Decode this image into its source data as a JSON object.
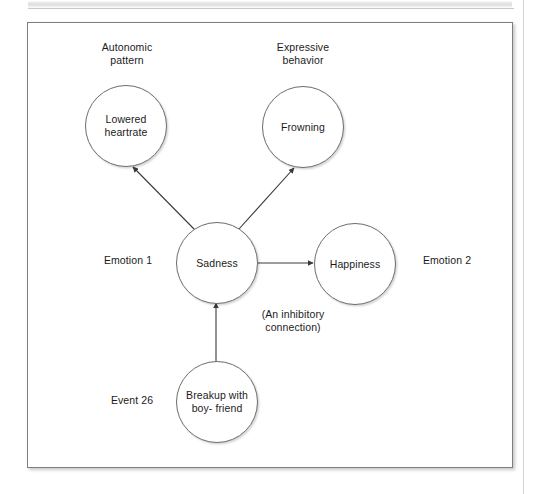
{
  "figure": {
    "nodes": [
      {
        "id": "lowered-heartrate",
        "label": "Lowered\nheartrate"
      },
      {
        "id": "frowning",
        "label": "Frowning"
      },
      {
        "id": "sadness",
        "label": "Sadness"
      },
      {
        "id": "happiness",
        "label": "Happiness"
      },
      {
        "id": "breakup",
        "label": "Breakup\nwith boy-\nfriend"
      }
    ],
    "captions": {
      "autonomic_pattern": "Autonomic\npattern",
      "expressive_behavior": "Expressive\nbehavior",
      "emotion_1": "Emotion 1",
      "emotion_2": "Emotion 2",
      "inhibitory_connection": "(An inhibitory\nconnection)",
      "event_26": "Event 26"
    },
    "edges": [
      {
        "id": "sadness-lowered-heartrate",
        "from": "sadness",
        "to": "lowered-heartrate",
        "arrows": "both"
      },
      {
        "id": "sadness-frowning",
        "from": "sadness",
        "to": "frowning",
        "arrows": "both"
      },
      {
        "id": "sadness-happiness",
        "from": "sadness",
        "to": "happiness",
        "arrows": "both"
      },
      {
        "id": "breakup-sadness",
        "from": "breakup",
        "to": "sadness",
        "arrows": "both"
      }
    ],
    "colors": {
      "stroke": "#6d6d6d",
      "edge": "#3a3a3a",
      "text": "#1b1b1b",
      "frame": "#7e7e7e",
      "background": "#ffffff"
    }
  }
}
